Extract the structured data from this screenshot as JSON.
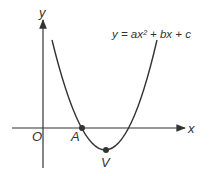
{
  "diagram": {
    "equation": "y = ax² + bx + c",
    "axes": {
      "x_label": "x",
      "y_label": "y",
      "origin_label": "O"
    },
    "points": [
      {
        "label": "A",
        "description": "x-intercept"
      },
      {
        "label": "V",
        "description": "vertex"
      }
    ],
    "colors": {
      "stroke": "#333333",
      "background": "#ffffff"
    }
  }
}
